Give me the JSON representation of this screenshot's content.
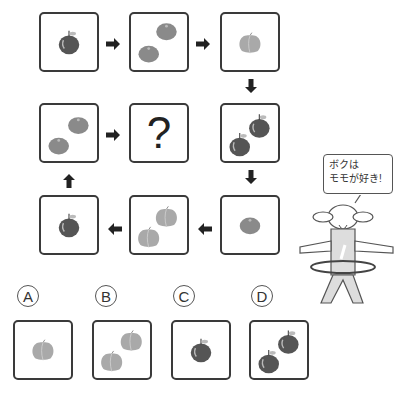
{
  "puzzle": {
    "sequence": [
      {
        "id": "s1",
        "fruit": "apple",
        "count": 1
      },
      {
        "id": "s2",
        "fruit": "tangerine",
        "count": 2
      },
      {
        "id": "s3",
        "fruit": "peach",
        "count": 1
      },
      {
        "id": "s4",
        "fruit": "apple",
        "count": 2
      },
      {
        "id": "s5",
        "fruit": "tangerine",
        "count": 1
      },
      {
        "id": "s6",
        "fruit": "peach",
        "count": 2
      },
      {
        "id": "s7",
        "fruit": "apple",
        "count": 1
      },
      {
        "id": "s8",
        "fruit": "tangerine",
        "count": 2
      },
      {
        "id": "s9",
        "fruit": "unknown",
        "label": "?"
      }
    ],
    "unknown_label": "?"
  },
  "options": [
    {
      "label": "A",
      "fruit": "peach",
      "count": 1
    },
    {
      "label": "B",
      "fruit": "peach",
      "count": 2
    },
    {
      "label": "C",
      "fruit": "apple",
      "count": 1
    },
    {
      "label": "D",
      "fruit": "apple",
      "count": 2
    }
  ],
  "character": {
    "speech_line1": "ボクは",
    "speech_line2": "モモが好き!"
  },
  "colors": {
    "apple": "#555555",
    "tangerine": "#8a8a8a",
    "peach": "#a9a9a9",
    "border": "#3a3a3a"
  }
}
